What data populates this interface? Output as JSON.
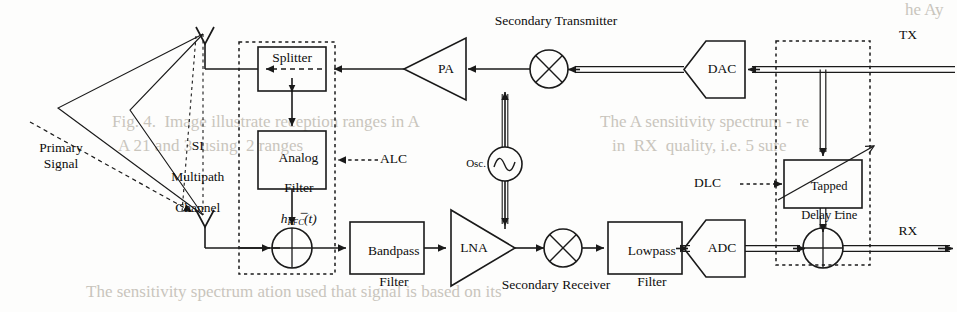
{
  "figure": {
    "domain": "block-diagram"
  },
  "colors": {
    "line": "#1a1a1a",
    "dashed": "#1a1a1a",
    "background": "#fdfdfc",
    "text": "#0d0d0d",
    "bleedthrough": "#c9c5bd"
  },
  "labels": {
    "secondary_transmitter": "Secondary Transmitter",
    "secondary_receiver": "Secondary Receiver",
    "primary_signal": "Primary\nSignal",
    "si_channel_line1": "SI",
    "si_channel_line2": "Multipath",
    "si_channel_line3": "Channel",
    "alc": "ALC",
    "dlc": "DLC",
    "tx_port": "TX",
    "rx_port": "RX",
    "minus_analog": "−",
    "minus_digital": "−"
  },
  "blocks": {
    "splitter": {
      "label": "Splitter"
    },
    "analog_filter": {
      "line1": "Analog",
      "line2": "Filter",
      "symbol_h": "h",
      "symbol_sub": "RFC",
      "symbol_arg": "(t)"
    },
    "bandpass_filter": {
      "line1": "Bandpass",
      "line2": "Filter"
    },
    "lowpass_filter": {
      "line1": "Lowpass",
      "line2": "Filter"
    },
    "tapped_delay_line": {
      "line1": "Tapped",
      "line2": "Delay Line"
    },
    "pa": {
      "label": "PA"
    },
    "lna": {
      "label": "LNA"
    },
    "dac": {
      "label": "DAC"
    },
    "adc": {
      "label": "ADC"
    },
    "oscillator": {
      "label": "Osc.",
      "glyph": "sine-wave-icon"
    }
  },
  "icons": {
    "tx_antenna": "antenna-icon",
    "rx_antenna": "antenna-icon",
    "mixer_tx": "mixer-icon",
    "mixer_rx": "mixer-icon",
    "summer_analog": "summing-junction-icon",
    "summer_digital": "summing-junction-icon",
    "oscillator": "oscillator-icon",
    "adjust_arrow": "adjustable-parameter-arrow-icon"
  },
  "page_bleedthrough": [
    {
      "text": "he Ay",
      "x": 905,
      "y": 4
    },
    {
      "text": "Fig. 4.  Image illustrate reception ranges in A",
      "x": 112,
      "y": 118
    },
    {
      "text": "A 21 and 3  using  2 ranges",
      "x": 118,
      "y": 140
    },
    {
      "text": "The A sensitivity spectrum - re",
      "x": 600,
      "y": 118
    },
    {
      "text": "in  RX  quality, i.e. 5 sure",
      "x": 612,
      "y": 142
    },
    {
      "text": "The sensitivity spectrum ation used that signal is based on its",
      "x": 86,
      "y": 288
    }
  ]
}
